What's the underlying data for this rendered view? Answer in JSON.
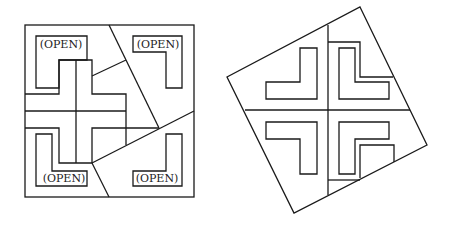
{
  "figure": {
    "left_panel": {
      "description": "Square dissected into pieces with four L-shaped openings and a central cross",
      "labels": [
        "(OPEN)",
        "(OPEN)",
        "(OPEN)",
        "(OPEN)"
      ]
    },
    "right_panel": {
      "description": "Rotated square assembled from the same pieces, with four L-shaped holes around a central cross"
    },
    "colors": {
      "line": "#1a1a1a",
      "background": "#ffffff"
    }
  }
}
